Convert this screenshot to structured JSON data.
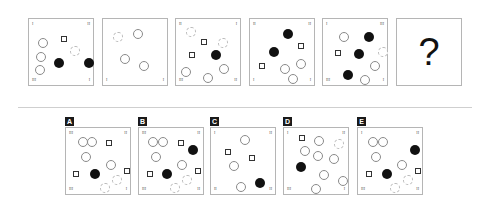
{
  "puzzle": {
    "sequence": [
      {
        "id": "panel-1",
        "x": 28,
        "y": 18,
        "corners": {
          "tl": "I",
          "tr": "II",
          "bl": "III",
          "br": "I"
        },
        "shapes": [
          {
            "type": "circle",
            "x": 9,
            "y": 19
          },
          {
            "type": "circle",
            "x": 7,
            "y": 33
          },
          {
            "type": "circle",
            "x": 6,
            "y": 46
          },
          {
            "type": "square",
            "x": 32,
            "y": 17
          },
          {
            "type": "circle-light",
            "x": 41,
            "y": 27
          },
          {
            "type": "dot",
            "x": 25,
            "y": 39
          },
          {
            "type": "dot",
            "x": 55,
            "y": 39
          }
        ]
      },
      {
        "id": "panel-2",
        "x": 102,
        "y": 18,
        "corners": {
          "tl": "",
          "tr": "",
          "bl": "I",
          "br": "I"
        },
        "shapes": [
          {
            "type": "circle-light",
            "x": 10,
            "y": 13
          },
          {
            "type": "circle",
            "x": 30,
            "y": 10
          },
          {
            "type": "circle",
            "x": 17,
            "y": 35
          },
          {
            "type": "circle",
            "x": 36,
            "y": 42
          }
        ]
      },
      {
        "id": "panel-3",
        "x": 175,
        "y": 18,
        "corners": {
          "tl": "II",
          "tr": "I",
          "bl": "III",
          "br": "II"
        },
        "shapes": [
          {
            "type": "circle-light",
            "x": 10,
            "y": 8
          },
          {
            "type": "square",
            "x": 25,
            "y": 20
          },
          {
            "type": "circle-light",
            "x": 42,
            "y": 19
          },
          {
            "type": "dot",
            "x": 35,
            "y": 31
          },
          {
            "type": "square",
            "x": 13,
            "y": 33
          },
          {
            "type": "circle",
            "x": 43,
            "y": 45
          },
          {
            "type": "circle",
            "x": 5,
            "y": 48
          },
          {
            "type": "circle",
            "x": 27,
            "y": 54
          }
        ]
      },
      {
        "id": "panel-4",
        "x": 249,
        "y": 18,
        "corners": {
          "tl": "II",
          "tr": "II",
          "bl": "I",
          "br": "I"
        },
        "shapes": [
          {
            "type": "dot",
            "x": 33,
            "y": 10
          },
          {
            "type": "square",
            "x": 48,
            "y": 24
          },
          {
            "type": "dot",
            "x": 19,
            "y": 28
          },
          {
            "type": "square",
            "x": 9,
            "y": 44
          },
          {
            "type": "circle",
            "x": 46,
            "y": 40
          },
          {
            "type": "circle",
            "x": 30,
            "y": 45
          },
          {
            "type": "circle",
            "x": 38,
            "y": 55
          }
        ]
      },
      {
        "id": "panel-5",
        "x": 322,
        "y": 18,
        "corners": {
          "tl": "I",
          "tr": "III",
          "bl": "III",
          "br": "I"
        },
        "shapes": [
          {
            "type": "circle",
            "x": 16,
            "y": 13
          },
          {
            "type": "dot",
            "x": 41,
            "y": 13
          },
          {
            "type": "square",
            "x": 12,
            "y": 31
          },
          {
            "type": "dot",
            "x": 31,
            "y": 30
          },
          {
            "type": "circle-light",
            "x": 55,
            "y": 28
          },
          {
            "type": "circle",
            "x": 47,
            "y": 42
          },
          {
            "type": "dot",
            "x": 20,
            "y": 51
          },
          {
            "type": "circle",
            "x": 37,
            "y": 56
          }
        ]
      },
      {
        "id": "panel-question",
        "x": 396,
        "y": 18,
        "question_mark": "?"
      }
    ],
    "options": [
      {
        "label": "A",
        "x": 65,
        "y": 127,
        "corners": {
          "tl": "III",
          "tr": "II",
          "bl": "III",
          "br": "I"
        },
        "shapes": [
          {
            "type": "circle",
            "x": 12,
            "y": 9
          },
          {
            "type": "circle",
            "x": 21,
            "y": 9
          },
          {
            "type": "square",
            "x": 40,
            "y": 12
          },
          {
            "type": "circle",
            "x": 15,
            "y": 24
          },
          {
            "type": "circle",
            "x": 40,
            "y": 32
          },
          {
            "type": "square",
            "x": 7,
            "y": 43
          },
          {
            "type": "dot",
            "x": 24,
            "y": 41
          },
          {
            "type": "square",
            "x": 58,
            "y": 40
          },
          {
            "type": "circle-light",
            "x": 46,
            "y": 47
          },
          {
            "type": "circle-light",
            "x": 34,
            "y": 55
          }
        ]
      },
      {
        "label": "B",
        "x": 138,
        "y": 127,
        "corners": {
          "tl": "III",
          "tr": "II",
          "bl": "III",
          "br": "II"
        },
        "shapes": [
          {
            "type": "circle",
            "x": 9,
            "y": 9
          },
          {
            "type": "circle",
            "x": 19,
            "y": 9
          },
          {
            "type": "square",
            "x": 39,
            "y": 12
          },
          {
            "type": "dot",
            "x": 49,
            "y": 17
          },
          {
            "type": "circle",
            "x": 12,
            "y": 24
          },
          {
            "type": "circle",
            "x": 38,
            "y": 32
          },
          {
            "type": "square",
            "x": 8,
            "y": 43
          },
          {
            "type": "dot",
            "x": 23,
            "y": 41
          },
          {
            "type": "square",
            "x": 56,
            "y": 40
          },
          {
            "type": "circle-light",
            "x": 43,
            "y": 47
          },
          {
            "type": "circle-light",
            "x": 31,
            "y": 55
          }
        ]
      },
      {
        "label": "C",
        "x": 210,
        "y": 127,
        "corners": {
          "tl": "I",
          "tr": "II",
          "bl": "II",
          "br": "II"
        },
        "shapes": [
          {
            "type": "circle",
            "x": 29,
            "y": 7
          },
          {
            "type": "square",
            "x": 14,
            "y": 21
          },
          {
            "type": "square",
            "x": 38,
            "y": 27
          },
          {
            "type": "circle",
            "x": 18,
            "y": 33
          },
          {
            "type": "dot",
            "x": 44,
            "y": 50
          },
          {
            "type": "circle",
            "x": 25,
            "y": 54
          }
        ]
      },
      {
        "label": "D",
        "x": 283,
        "y": 127,
        "corners": {
          "tl": "I",
          "tr": "II",
          "bl": "III",
          "br": "I"
        },
        "shapes": [
          {
            "type": "square",
            "x": 15,
            "y": 7
          },
          {
            "type": "circle",
            "x": 30,
            "y": 8
          },
          {
            "type": "circle-light",
            "x": 50,
            "y": 11
          },
          {
            "type": "circle",
            "x": 16,
            "y": 18
          },
          {
            "type": "circle",
            "x": 29,
            "y": 23
          },
          {
            "type": "circle",
            "x": 45,
            "y": 26
          },
          {
            "type": "dot",
            "x": 12,
            "y": 34
          },
          {
            "type": "circle",
            "x": 35,
            "y": 42
          },
          {
            "type": "circle",
            "x": 54,
            "y": 48
          },
          {
            "type": "circle",
            "x": 27,
            "y": 56
          }
        ]
      },
      {
        "label": "E",
        "x": 357,
        "y": 127,
        "corners": {
          "tl": "I",
          "tr": "II",
          "bl": "III",
          "br": "II"
        },
        "shapes": [
          {
            "type": "circle",
            "x": 10,
            "y": 9
          },
          {
            "type": "circle",
            "x": 20,
            "y": 9
          },
          {
            "type": "dot",
            "x": 52,
            "y": 17
          },
          {
            "type": "circle",
            "x": 13,
            "y": 24
          },
          {
            "type": "circle",
            "x": 39,
            "y": 32
          },
          {
            "type": "square",
            "x": 8,
            "y": 43
          },
          {
            "type": "dot",
            "x": 24,
            "y": 41
          },
          {
            "type": "square",
            "x": 57,
            "y": 40
          },
          {
            "type": "circle-light",
            "x": 45,
            "y": 47
          },
          {
            "type": "circle-light",
            "x": 32,
            "y": 55
          }
        ]
      }
    ]
  },
  "colors": {
    "border": "#b5b5b5",
    "dot": "#111111",
    "circle": "#8a8a8a",
    "divider": "#cfcfcf",
    "badge": "#1a1a1a"
  }
}
